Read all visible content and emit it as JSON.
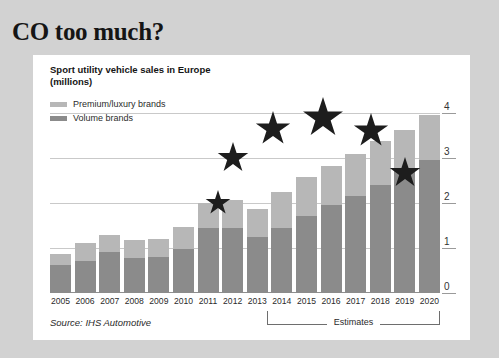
{
  "headline": "CO too much?",
  "chart_title": "Sport utility vehicle sales in Europe\n(millions)",
  "chart_title_line1": "Sport utility vehicle sales in Europe",
  "chart_title_line2": "(millions)",
  "legend": [
    {
      "label": "Premium/luxury brands",
      "color": "#b7b7b7",
      "key": "premium"
    },
    {
      "label": "Volume brands",
      "color": "#8b8b8b",
      "key": "volume"
    }
  ],
  "estimates": {
    "label": "Estimates",
    "start_year": "2014",
    "end_year": "2020"
  },
  "source": "Source: IHS Automotive",
  "stars": {
    "count": 6,
    "color": "#1d1d1d",
    "positions": [
      {
        "cx": 185,
        "cy": 148,
        "r": 13
      },
      {
        "cx": 200,
        "cy": 103,
        "r": 16
      },
      {
        "cx": 240,
        "cy": 74,
        "r": 18
      },
      {
        "cx": 290,
        "cy": 63,
        "r": 21
      },
      {
        "cx": 338,
        "cy": 76,
        "r": 18
      },
      {
        "cx": 372,
        "cy": 118,
        "r": 16
      }
    ]
  },
  "chart_data": {
    "type": "bar",
    "subtype": "stacked-bar",
    "title": "Sport utility vehicle sales in Europe (millions)",
    "xlabel": "",
    "ylabel": "millions",
    "ylim": [
      0,
      4
    ],
    "yticks": [
      "0",
      "1",
      "2",
      "3",
      "4"
    ],
    "grid": true,
    "legend_position": "top-left",
    "categories": [
      "2005",
      "2006",
      "2007",
      "2008",
      "2009",
      "2010",
      "2011",
      "2012",
      "2013",
      "2014",
      "2015",
      "2016",
      "2017",
      "2018",
      "2019",
      "2020"
    ],
    "series": [
      {
        "name": "Volume brands",
        "color": "#8b8b8b",
        "values": [
          0.62,
          0.72,
          0.92,
          0.78,
          0.8,
          0.98,
          1.45,
          1.45,
          1.25,
          1.45,
          1.72,
          1.95,
          2.15,
          2.4,
          2.72,
          2.95
        ]
      },
      {
        "name": "Premium/luxury brands",
        "color": "#b7b7b7",
        "values": [
          0.25,
          0.4,
          0.38,
          0.4,
          0.4,
          0.48,
          0.55,
          0.62,
          0.62,
          0.8,
          0.85,
          0.88,
          0.95,
          0.98,
          0.9,
          1.0
        ]
      }
    ],
    "totals": [
      0.87,
      1.12,
      1.3,
      1.18,
      1.2,
      1.46,
      2.0,
      2.07,
      1.87,
      2.25,
      2.57,
      2.83,
      3.1,
      3.38,
      3.62,
      3.95
    ],
    "estimates_from": "2014",
    "annotation": "Estimates",
    "source": "Source: IHS Automotive"
  }
}
